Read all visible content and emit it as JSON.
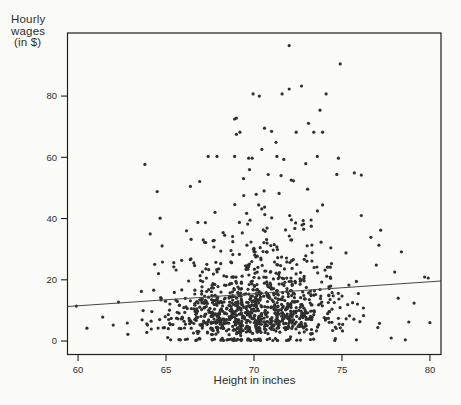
{
  "figure": {
    "y_axis_title_lines": [
      "Hourly",
      "wages",
      "(in $)"
    ],
    "x_axis_title": "Height in inches"
  },
  "chart_data": {
    "type": "scatter",
    "title": "",
    "xlabel": "Height in inches",
    "ylabel": "Hourly wages (in $)",
    "x_ticks": [
      60,
      65,
      70,
      75,
      80
    ],
    "y_ticks": [
      0,
      20,
      40,
      60,
      80
    ],
    "xlim": [
      59.4,
      80.63
    ],
    "ylim": [
      -4.4,
      100.6
    ],
    "grid": false,
    "legend": "none",
    "background": "#fbfbf8",
    "axis_color": "#1f1f1f",
    "label_color": "#2e2e2e",
    "point_color": "#2f2f2f",
    "point_radius": 1.6,
    "trend_line": {
      "x": [
        59.4,
        80.63
      ],
      "y": [
        11.3,
        19.6
      ],
      "color": "#474747",
      "width": 1.1,
      "description": "fitted regression line, wage rises about 0.39 $ per inch"
    },
    "notable_points": [
      [
        72.0,
        96.5
      ],
      [
        74.9,
        90.5
      ],
      [
        69.95,
        80.7
      ],
      [
        70.3,
        80.0
      ],
      [
        71.6,
        80.7
      ],
      [
        72.0,
        82.3
      ],
      [
        72.7,
        83.3
      ],
      [
        74.1,
        80.7
      ],
      [
        69.0,
        72.8
      ],
      [
        68.9,
        72.5
      ],
      [
        73.75,
        75.4
      ],
      [
        73.1,
        71.1
      ],
      [
        69.2,
        68.2
      ],
      [
        70.6,
        69.5
      ],
      [
        71.0,
        68.5
      ],
      [
        72.4,
        68.2
      ],
      [
        73.4,
        68.2
      ],
      [
        73.9,
        68.2
      ],
      [
        69.0,
        67.5
      ],
      [
        71.25,
        64.9
      ],
      [
        70.45,
        62.6
      ],
      [
        71.3,
        60.3
      ],
      [
        67.4,
        60.3
      ],
      [
        67.9,
        60.3
      ],
      [
        68.9,
        60.3
      ],
      [
        69.7,
        59.7
      ],
      [
        69.9,
        59.7
      ],
      [
        73.6,
        60.3
      ],
      [
        74.8,
        59.7
      ],
      [
        59.9,
        11.4
      ],
      [
        60.5,
        4.2
      ],
      [
        61.4,
        7.8
      ],
      [
        62.0,
        5.2
      ],
      [
        62.8,
        5.9
      ],
      [
        62.3,
        12.7
      ],
      [
        63.8,
        57.7
      ],
      [
        64.5,
        48.8
      ],
      [
        64.1,
        35.0
      ],
      [
        63.6,
        16.2
      ],
      [
        64.2,
        9.6
      ],
      [
        64.8,
        25.8
      ],
      [
        75.7,
        54.9
      ],
      [
        76.1,
        54.2
      ],
      [
        77.2,
        36.2
      ],
      [
        76.1,
        41.0
      ],
      [
        77.1,
        31.3
      ],
      [
        76.95,
        24.8
      ],
      [
        78.0,
        22.5
      ],
      [
        79.7,
        20.9
      ],
      [
        79.9,
        20.6
      ],
      [
        78.2,
        14.0
      ],
      [
        79.1,
        12.4
      ],
      [
        78.8,
        6.2
      ],
      [
        80.0,
        6.0
      ],
      [
        77.8,
        1.0
      ],
      [
        78.6,
        0.4
      ]
    ],
    "cloud": {
      "comment": "dense cloud of ~1100 unlabeled points reproduced statistically",
      "seed": 1337,
      "n": 1100,
      "height": {
        "mean": 69.95,
        "sd": 2.45,
        "min": 63.0,
        "max": 77.7,
        "integer_fraction": 0.75,
        "jitter": 0.45
      },
      "wage": {
        "log_mean": 2.42,
        "log_sd": 0.68,
        "log_slope_per_inch": 0.042,
        "min": 0.15,
        "max": 62,
        "zero_fraction": 0.04
      }
    }
  }
}
